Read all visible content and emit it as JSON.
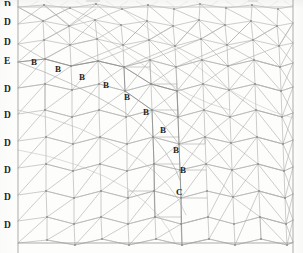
{
  "figure": {
    "type": "mesh-diagram",
    "background_color": "#fdfdfc",
    "mesh_line_color": "#a9a9a9",
    "boundary_line_color": "#9a9a9a",
    "node_color": "#8d8d8d",
    "label_color": "#262626"
  },
  "left_margin_labels": [
    {
      "text": "D",
      "x": 4,
      "y": 1,
      "clipped": true
    },
    {
      "text": "D",
      "x": 4,
      "y": 18
    },
    {
      "text": "D",
      "x": 4,
      "y": 38
    },
    {
      "text": "E",
      "x": 4,
      "y": 57
    },
    {
      "text": "D",
      "x": 4,
      "y": 85
    },
    {
      "text": "D",
      "x": 4,
      "y": 111
    },
    {
      "text": "D",
      "x": 4,
      "y": 139
    },
    {
      "text": "D",
      "x": 4,
      "y": 166
    },
    {
      "text": "D",
      "x": 4,
      "y": 193
    },
    {
      "text": "D",
      "x": 4,
      "y": 221
    }
  ],
  "boundary_labels": [
    {
      "text": "B",
      "x": 31,
      "y": 58
    },
    {
      "text": "B",
      "x": 55,
      "y": 65
    },
    {
      "text": "B",
      "x": 79,
      "y": 73
    },
    {
      "text": "B",
      "x": 103,
      "y": 81
    },
    {
      "text": "B",
      "x": 124,
      "y": 93
    },
    {
      "text": "B",
      "x": 143,
      "y": 108
    },
    {
      "text": "B",
      "x": 160,
      "y": 126
    },
    {
      "text": "B",
      "x": 173,
      "y": 146
    },
    {
      "text": "B",
      "x": 180,
      "y": 166
    },
    {
      "text": "C",
      "x": 176,
      "y": 188
    }
  ],
  "label_legend": {
    "D": "Dirichlet boundary node",
    "E": "Edge / essential boundary node",
    "B": "Interior interface boundary node",
    "C": "Corner node"
  },
  "geometry": {
    "left_boundary_x": 18,
    "right_boundary_x": 293,
    "top_boundary_y": 7,
    "bottom_boundary_y": 243
  }
}
